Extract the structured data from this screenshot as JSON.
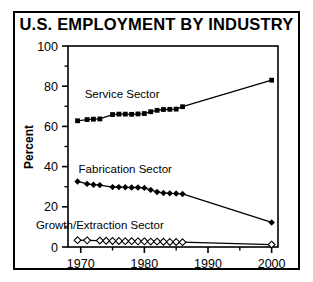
{
  "figure": {
    "title": "U.S. EMPLOYMENT BY INDUSTRY",
    "ylabel": "Percent",
    "border_color": "#000000",
    "background": "#ffffff"
  },
  "chart_data": {
    "type": "line",
    "title": "U.S. EMPLOYMENT BY INDUSTRY",
    "xlabel": "",
    "ylabel": "Percent",
    "xlim": [
      1968,
      2001
    ],
    "ylim": [
      0,
      100
    ],
    "xticks": [
      1970,
      1980,
      1990,
      2000
    ],
    "xtick_labels": [
      "1970",
      "1980",
      "1990",
      "2000"
    ],
    "xminorticks": [
      1975,
      1985,
      1995
    ],
    "yticks": [
      0,
      20,
      40,
      60,
      80,
      100
    ],
    "ytick_labels": [
      "0",
      "20",
      "40",
      "60",
      "80",
      "100"
    ],
    "yminorticks": [
      10,
      30,
      50,
      70,
      90
    ],
    "grid": false,
    "legend_position": "inline-annotations",
    "series": [
      {
        "name": "Service Sector",
        "marker": "filled-square",
        "color": "#000000",
        "label_x": 1976.5,
        "label_y": 74,
        "points": [
          {
            "x": 1969.5,
            "y": 62.8
          },
          {
            "x": 1971.0,
            "y": 63.4
          },
          {
            "x": 1972.0,
            "y": 63.6
          },
          {
            "x": 1973.0,
            "y": 63.7
          },
          {
            "x": 1975.0,
            "y": 65.9
          },
          {
            "x": 1976.0,
            "y": 66.1
          },
          {
            "x": 1977.0,
            "y": 66.1
          },
          {
            "x": 1978.0,
            "y": 66.0
          },
          {
            "x": 1979.0,
            "y": 66.2
          },
          {
            "x": 1980.0,
            "y": 66.4
          },
          {
            "x": 1981.0,
            "y": 67.3
          },
          {
            "x": 1982.0,
            "y": 68.0
          },
          {
            "x": 1983.0,
            "y": 68.4
          },
          {
            "x": 1984.0,
            "y": 68.5
          },
          {
            "x": 1985.0,
            "y": 68.6
          },
          {
            "x": 1986.0,
            "y": 69.8
          },
          {
            "x": 2000.0,
            "y": 83.0
          }
        ]
      },
      {
        "name": "Fabrication Sector",
        "marker": "filled-diamond",
        "color": "#000000",
        "label_x": 1977.0,
        "label_y": 37,
        "points": [
          {
            "x": 1969.5,
            "y": 32.6
          },
          {
            "x": 1971.0,
            "y": 31.4
          },
          {
            "x": 1972.0,
            "y": 31.0
          },
          {
            "x": 1973.0,
            "y": 30.8
          },
          {
            "x": 1975.0,
            "y": 29.8
          },
          {
            "x": 1976.0,
            "y": 29.8
          },
          {
            "x": 1977.0,
            "y": 29.7
          },
          {
            "x": 1978.0,
            "y": 29.6
          },
          {
            "x": 1979.0,
            "y": 29.6
          },
          {
            "x": 1980.0,
            "y": 29.4
          },
          {
            "x": 1981.0,
            "y": 28.4
          },
          {
            "x": 1982.0,
            "y": 27.4
          },
          {
            "x": 1983.0,
            "y": 26.9
          },
          {
            "x": 1984.0,
            "y": 26.7
          },
          {
            "x": 1985.0,
            "y": 26.6
          },
          {
            "x": 1986.0,
            "y": 26.4
          },
          {
            "x": 2000.0,
            "y": 12.2
          }
        ]
      },
      {
        "name": "Growth/Extraction Sector",
        "marker": "open-diamond",
        "color": "#000000",
        "label_x": 1973.0,
        "label_y": 9,
        "points": [
          {
            "x": 1969.5,
            "y": 3.4
          },
          {
            "x": 1971.0,
            "y": 3.3
          },
          {
            "x": 1973.0,
            "y": 3.2
          },
          {
            "x": 1974.0,
            "y": 3.1
          },
          {
            "x": 1975.0,
            "y": 3.0
          },
          {
            "x": 1976.0,
            "y": 3.0
          },
          {
            "x": 1977.0,
            "y": 2.9
          },
          {
            "x": 1978.0,
            "y": 2.9
          },
          {
            "x": 1979.0,
            "y": 2.8
          },
          {
            "x": 1980.0,
            "y": 2.8
          },
          {
            "x": 1981.0,
            "y": 2.7
          },
          {
            "x": 1982.0,
            "y": 2.7
          },
          {
            "x": 1983.0,
            "y": 2.6
          },
          {
            "x": 1984.0,
            "y": 2.5
          },
          {
            "x": 1985.0,
            "y": 2.5
          },
          {
            "x": 1986.0,
            "y": 2.4
          },
          {
            "x": 2000.0,
            "y": 1.2
          }
        ]
      }
    ]
  }
}
